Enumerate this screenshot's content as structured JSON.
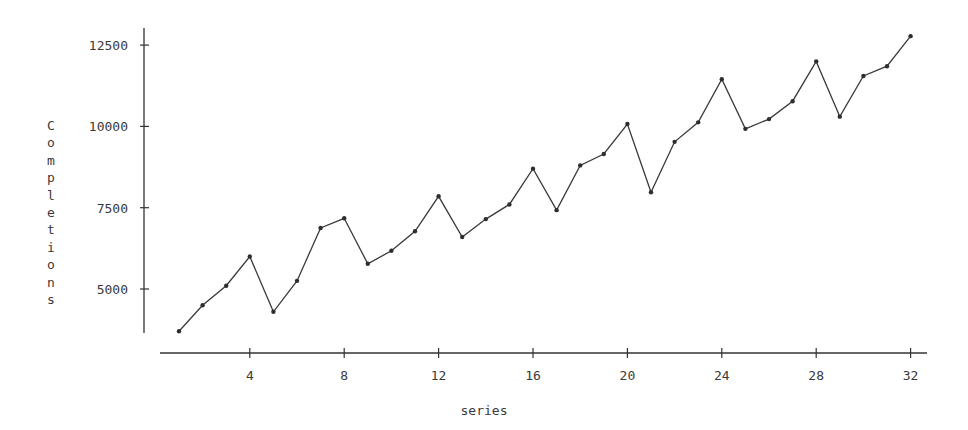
{
  "chart_data": {
    "type": "line",
    "title": "",
    "xlabel": "series",
    "ylabel": "Completions",
    "x": [
      1,
      2,
      3,
      4,
      5,
      6,
      7,
      8,
      9,
      10,
      11,
      12,
      13,
      14,
      15,
      16,
      17,
      18,
      19,
      20,
      21,
      22,
      23,
      24,
      25,
      26,
      27,
      28,
      29,
      30,
      31,
      32
    ],
    "series": [
      {
        "name": "Completions",
        "values": [
          3700,
          4500,
          5100,
          6000,
          4300,
          5250,
          6875,
          7175,
          5775,
          6175,
          6775,
          7850,
          6600,
          7150,
          7600,
          8700,
          7425,
          8800,
          9150,
          10075,
          7975,
          9525,
          10125,
          11450,
          9925,
          10225,
          10775,
          12000,
          10300,
          11550,
          11850,
          12775
        ]
      }
    ],
    "x_ticks": [
      4,
      8,
      12,
      16,
      20,
      24,
      28,
      32
    ],
    "y_ticks": [
      5000,
      7500,
      10000,
      12500
    ],
    "xlim": [
      0.2,
      32.6
    ],
    "ylim": [
      3300,
      13000
    ],
    "grid": false,
    "legend": null,
    "markers": true
  },
  "labels": {
    "xlabel": "series",
    "ylabel": "Completions"
  }
}
